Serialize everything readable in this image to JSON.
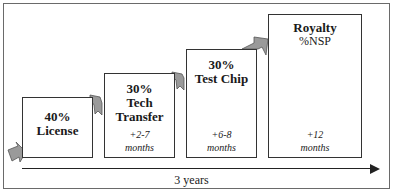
{
  "diagram": {
    "steps": [
      {
        "percent": "40%",
        "title": "License",
        "duration_value": "",
        "duration_unit": ""
      },
      {
        "percent": "30%",
        "title": "Tech Transfer",
        "title_line1": "Tech",
        "title_line2": "Transfer",
        "duration_value": "+2-7",
        "duration_unit": "months"
      },
      {
        "percent": "30%",
        "title": "Test Chip",
        "duration_value": "+6-8",
        "duration_unit": "months"
      },
      {
        "percent": "",
        "title": "Royalty",
        "subtitle": "%NSP",
        "duration_value": "+12",
        "duration_unit": "months"
      }
    ],
    "timeline": {
      "label": "3 years"
    },
    "colors": {
      "arrow_fill": "#9a9a9a",
      "border": "#333333",
      "frame": "#6a6a6a"
    }
  }
}
